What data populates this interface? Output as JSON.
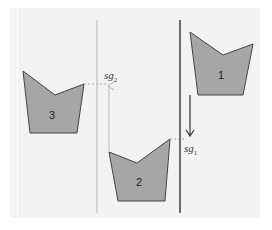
{
  "diagram": {
    "colors": {
      "panel": "#f3f3f3",
      "shape_fill": "#a6a6a6",
      "shape_stroke": "#444444",
      "thin_line": "#b0b0b0",
      "thick_line": "#4a4a4a",
      "dashed": "#aaaaaa"
    },
    "shapes": [
      {
        "id": "1",
        "label": "1",
        "points": "190,32 223,55 253,44 243,95 198,95",
        "label_x": 221,
        "label_y": 79
      },
      {
        "id": "2",
        "label": "2",
        "points": "109,152 137,163 170,139 165,201 118,201",
        "label_x": 139,
        "label_y": 186
      },
      {
        "id": "3",
        "label": "3",
        "points": "23,71 55,95 84,84 77,133 30,133",
        "label_x": 52,
        "label_y": 119
      }
    ],
    "lines": {
      "thin_vertical": {
        "x": 97,
        "y1": 20,
        "y2": 213
      },
      "thick_vertical": {
        "x": 180,
        "y1": 20,
        "y2": 213
      }
    },
    "sg2": {
      "label_base": "sg",
      "label_sub": "2",
      "x": 105,
      "y": 80
    },
    "sg1": {
      "label_base": "sg",
      "label_sub": "1",
      "x": 183,
      "y": 153
    }
  }
}
